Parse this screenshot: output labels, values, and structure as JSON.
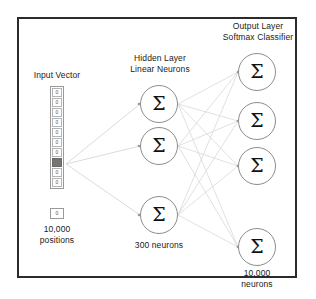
{
  "diagram": {
    "title_semantic": "word2vec skip-gram neural network architecture",
    "frame_color": "#2b2b2b",
    "neuron_stroke": "#8c8c8c",
    "wire_color": "#cfcfcf",
    "highlight_color": "#757575",
    "sigma_glyph": "Σ"
  },
  "labels": {
    "input_vector": "Input Vector",
    "hidden_layer": "Hidden Layer\nLinear Neurons",
    "output_layer": "Output Layer\nSoftmax Classifier",
    "input_count": "10,000\npositions",
    "hidden_count": "300 neurons",
    "output_count": "10,000\nneurons"
  },
  "input_vector": {
    "cell_value_off": "0",
    "cell_value_on": "1",
    "lone_cell_value": "0",
    "cells": [
      {
        "value": "0",
        "active": false
      },
      {
        "value": "0",
        "active": false
      },
      {
        "value": "0",
        "active": false
      },
      {
        "value": "0",
        "active": false
      },
      {
        "value": "0",
        "active": false
      },
      {
        "value": "0",
        "active": false
      },
      {
        "value": "0",
        "active": false
      },
      {
        "value": "1",
        "active": true
      },
      {
        "value": "0",
        "active": false
      },
      {
        "value": "0",
        "active": false
      }
    ]
  },
  "hidden_neurons": [
    {
      "label": "Σ"
    },
    {
      "label": "Σ"
    },
    {
      "label": "Σ"
    }
  ],
  "output_neurons": [
    {
      "label": "Σ"
    },
    {
      "label": "Σ"
    },
    {
      "label": "Σ"
    },
    {
      "label": "Σ"
    }
  ]
}
